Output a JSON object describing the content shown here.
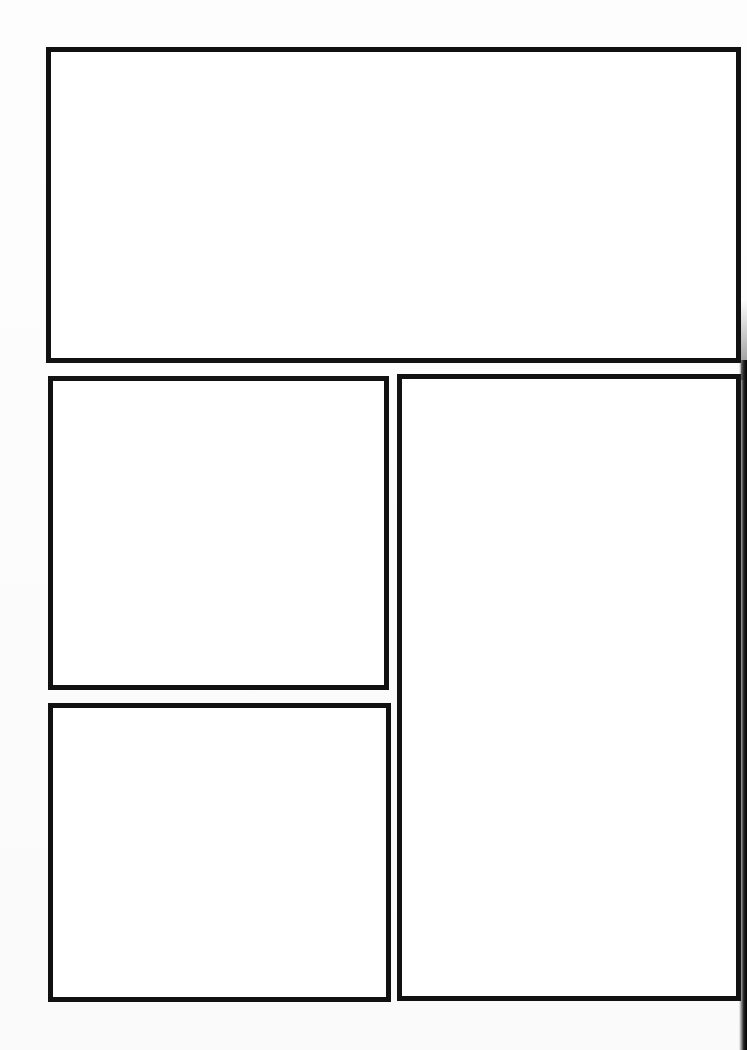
{
  "page": {
    "type": "blank comic panel template",
    "background_color": "#fcfcfc",
    "border_color": "#111111"
  },
  "panels": [
    {
      "id": "top-wide",
      "label": "",
      "x": 46,
      "y": 47,
      "width": 695,
      "height": 316
    },
    {
      "id": "middle-left",
      "label": "",
      "x": 48,
      "y": 376,
      "width": 341,
      "height": 314
    },
    {
      "id": "bottom-left",
      "label": "",
      "x": 48,
      "y": 703,
      "width": 343,
      "height": 299
    },
    {
      "id": "right-tall",
      "label": "",
      "x": 397,
      "y": 374,
      "width": 344,
      "height": 627
    }
  ]
}
